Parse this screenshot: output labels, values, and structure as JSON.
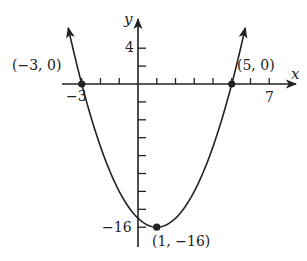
{
  "chart_data": {
    "type": "line",
    "title": "",
    "function": "y = (x - 1)^2 - 16",
    "xlabel": "x",
    "ylabel": "y",
    "x_tick_labels": [
      {
        "value": -3,
        "text": "−3"
      },
      {
        "value": 7,
        "text": "7"
      }
    ],
    "y_tick_labels": [
      {
        "value": 4,
        "text": "4"
      },
      {
        "value": -16,
        "text": "−16"
      }
    ],
    "x_tick_step": 1,
    "y_tick_step": 2,
    "xlim": [
      -3.5,
      7.5
    ],
    "ylim": [
      -17,
      6
    ],
    "grid": false,
    "points": [
      {
        "x": -3,
        "y": 0,
        "label": "(−3, 0)"
      },
      {
        "x": 5,
        "y": 0,
        "label": "(5, 0)"
      },
      {
        "x": 1,
        "y": -16,
        "label": "(1, −16)"
      }
    ],
    "curve_samples": {
      "x": [
        -3.7,
        -3,
        -2,
        -1,
        0,
        1,
        2,
        3,
        4,
        5,
        5.7
      ],
      "y": [
        6.09,
        0,
        -7,
        -12,
        -15,
        -16,
        -15,
        -12,
        -7,
        0,
        6.09
      ]
    }
  },
  "labels": {
    "x_axis": "x",
    "y_axis": "y",
    "tick_neg3": "−3",
    "tick_7": "7",
    "tick_4": "4",
    "tick_neg16": "−16",
    "pt_left": "(−3, 0)",
    "pt_right": "(5, 0)",
    "pt_vertex": "(1, −16)"
  },
  "colors": {
    "ink": "#222222",
    "background": "#ffffff"
  }
}
